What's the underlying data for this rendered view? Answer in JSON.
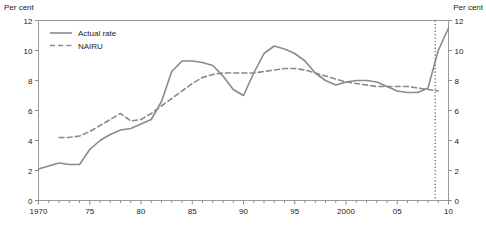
{
  "chart_data": {
    "type": "line",
    "title": "",
    "xlabel": "",
    "ylabel": "Per cent",
    "ylabel_right": "Per cent",
    "xlim": [
      1970,
      2010
    ],
    "ylim": [
      0,
      12
    ],
    "ytick_values": [
      0,
      2,
      4,
      6,
      8,
      10,
      12
    ],
    "ytick_labels": [
      "0",
      "2",
      "4",
      "6",
      "8",
      "10",
      "12"
    ],
    "xtick_values": [
      1970,
      1975,
      1980,
      1985,
      1990,
      1995,
      2000,
      2005,
      2010
    ],
    "xtick_labels": [
      "1970",
      "75",
      "80",
      "85",
      "90",
      "95",
      "2000",
      "05",
      "10"
    ],
    "x_minor_tick_step": 1,
    "grid": false,
    "legend_position": "top-left",
    "annotations": [
      {
        "name": "forecast-divider",
        "type": "vertical-dotted-line",
        "x": 2008.7,
        "color": "#4d4d4d"
      }
    ],
    "series": [
      {
        "name": "Actual rate",
        "style": "solid",
        "color": "#8a8a8a",
        "x": [
          1970,
          1971,
          1972,
          1973,
          1974,
          1975,
          1976,
          1977,
          1978,
          1979,
          1980,
          1981,
          1982,
          1983,
          1984,
          1985,
          1986,
          1987,
          1988,
          1989,
          1990,
          1991,
          1992,
          1993,
          1994,
          1995,
          1996,
          1997,
          1998,
          1999,
          2000,
          2001,
          2002,
          2003,
          2004,
          2005,
          2006,
          2007,
          2008,
          2009,
          2010
        ],
        "values": [
          2.1,
          2.3,
          2.5,
          2.4,
          2.4,
          3.4,
          4.0,
          4.4,
          4.7,
          4.8,
          5.1,
          5.4,
          6.6,
          8.6,
          9.3,
          9.3,
          9.2,
          9.0,
          8.3,
          7.4,
          7.0,
          8.5,
          9.8,
          10.3,
          10.1,
          9.8,
          9.3,
          8.5,
          8.0,
          7.7,
          7.9,
          8.0,
          8.0,
          7.9,
          7.6,
          7.3,
          7.2,
          7.2,
          7.5,
          10.0,
          11.5
        ]
      },
      {
        "name": "NAIRU",
        "style": "dashed",
        "color": "#8a8a8a",
        "x": [
          1972,
          1973,
          1974,
          1975,
          1976,
          1977,
          1978,
          1979,
          1980,
          1981,
          1982,
          1983,
          1984,
          1985,
          1986,
          1987,
          1988,
          1989,
          1990,
          1991,
          1992,
          1993,
          1994,
          1995,
          1996,
          1997,
          1998,
          1999,
          2000,
          2001,
          2002,
          2003,
          2004,
          2005,
          2006,
          2007,
          2008,
          2009
        ],
        "values": [
          4.2,
          4.2,
          4.3,
          4.6,
          5.0,
          5.4,
          5.8,
          5.3,
          5.4,
          5.8,
          6.3,
          6.8,
          7.3,
          7.8,
          8.2,
          8.4,
          8.5,
          8.5,
          8.5,
          8.5,
          8.6,
          8.7,
          8.8,
          8.8,
          8.7,
          8.5,
          8.3,
          8.1,
          7.9,
          7.8,
          7.7,
          7.6,
          7.6,
          7.6,
          7.6,
          7.5,
          7.4,
          7.3
        ]
      }
    ]
  },
  "legend": {
    "entries": [
      {
        "label": "Actual rate",
        "style": "solid"
      },
      {
        "label": "NAIRU",
        "style": "dashed"
      }
    ]
  }
}
